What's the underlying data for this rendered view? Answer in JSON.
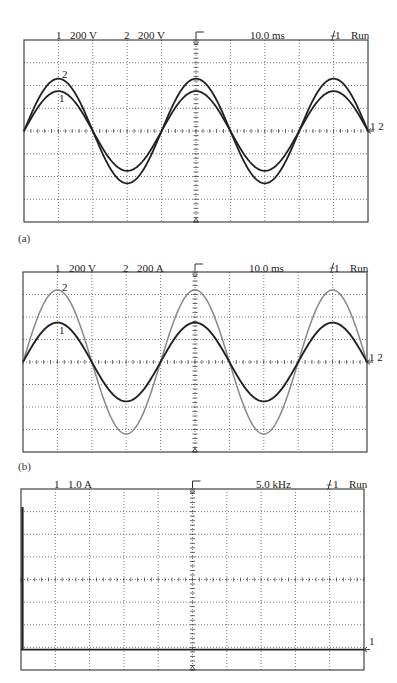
{
  "figure": {
    "panels": [
      {
        "id": "a",
        "caption": "(a)",
        "header": {
          "ch1_label": "1",
          "ch1_scale": "200 V",
          "ch2_label": "2",
          "ch2_scale": "200 V",
          "timebase": "10.0 ms",
          "trigger": "ŷ1",
          "trigger_text": "1",
          "status": "Run"
        },
        "trace_labels": {
          "ch1": "1",
          "ch2": "2",
          "ground": "1 2"
        }
      },
      {
        "id": "b",
        "caption": "(b)",
        "header": {
          "ch1_label": "1",
          "ch1_scale": "200 V",
          "ch2_label": "2",
          "ch2_scale": "200 A",
          "timebase": "10.0 ms",
          "trigger_text": "1",
          "status": "Run"
        },
        "trace_labels": {
          "ch1": "1",
          "ch2": "2",
          "ground": "1 2"
        }
      },
      {
        "id": "c",
        "caption": "",
        "header": {
          "ch1_label": "1",
          "ch1_scale": "1.0 A",
          "freq": "5.0 kHz",
          "trigger_text": "1",
          "status": "Run"
        },
        "trace_labels": {
          "ground": "1"
        }
      }
    ]
  },
  "chart_data": [
    {
      "type": "line",
      "title": "(a) Oscilloscope: voltage channels",
      "xlabel": "time (10.0 ms/div)",
      "ylabel": "divisions",
      "grid": true,
      "divisions": {
        "x": 10,
        "y": 8
      },
      "xlim": [
        0,
        10
      ],
      "ylim": [
        -4,
        4
      ],
      "series": [
        {
          "name": "Ch1 (200 V/div)",
          "waveform": "sine",
          "amplitude_div": 1.75,
          "period_div": 4,
          "phase_deg": 0,
          "color": "#222222"
        },
        {
          "name": "Ch2 (200 V/div)",
          "waveform": "sine",
          "amplitude_div": 2.3,
          "period_div": 4,
          "phase_deg": 0,
          "color": "#222222"
        }
      ]
    },
    {
      "type": "line",
      "title": "(b) Oscilloscope: voltage and current",
      "xlabel": "time (10.0 ms/div)",
      "ylabel": "divisions",
      "grid": true,
      "divisions": {
        "x": 10,
        "y": 8
      },
      "xlim": [
        0,
        10
      ],
      "ylim": [
        -4,
        4
      ],
      "series": [
        {
          "name": "Ch1 (200 V/div)",
          "waveform": "sine",
          "amplitude_div": 1.75,
          "period_div": 4,
          "phase_deg": 0,
          "color": "#222222"
        },
        {
          "name": "Ch2 (200 A/div)",
          "waveform": "sine",
          "amplitude_div": 3.2,
          "period_div": 4,
          "phase_deg": 0,
          "color": "#888888"
        }
      ]
    },
    {
      "type": "bar",
      "title": "(c) Spectrum: current",
      "xlabel": "frequency (5.0 kHz/div)",
      "ylabel": "1.0 A/div",
      "grid": true,
      "divisions": {
        "x": 10,
        "y": 8
      },
      "categories": [
        "fundamental"
      ],
      "values": [
        6.3
      ],
      "baseline_div_from_bottom": 0.9,
      "note": "single spectral line at left edge (~fundamental), baseline elsewhere"
    }
  ]
}
